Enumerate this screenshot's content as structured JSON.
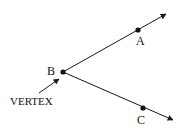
{
  "diagram": {
    "colors": {
      "line": "#1a1a1a",
      "text": "#111111",
      "background": "#ffffff"
    },
    "points": [
      {
        "id": "A",
        "label": "A",
        "x": 138,
        "y": 30
      },
      {
        "id": "B",
        "label": "B",
        "x": 63,
        "y": 72
      },
      {
        "id": "C",
        "label": "C",
        "x": 143,
        "y": 108
      }
    ],
    "rays": [
      {
        "id": "BA",
        "from": "B",
        "through": "A",
        "end": [
          166,
          13
        ]
      },
      {
        "id": "BC",
        "from": "B",
        "through": "C",
        "end": [
          173,
          121
        ]
      }
    ],
    "annotation": {
      "label": "VERTEX",
      "points_to": "B"
    }
  }
}
